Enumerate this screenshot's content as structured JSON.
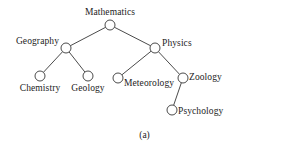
{
  "figure": {
    "caption": "(a)",
    "type": "tree-diagram",
    "background_color": "#ffffff",
    "line_color": "#2a2a2a",
    "text_color": "#1c1c1c"
  },
  "tree": {
    "nodes": [
      {
        "id": "mathematics",
        "label": "Mathematics",
        "x": 110,
        "y": 25,
        "r": 5,
        "label_x": 110,
        "label_y": 7,
        "label_align": "center"
      },
      {
        "id": "geography",
        "label": "Geography",
        "x": 66,
        "y": 48,
        "r": 5,
        "label_x": 59,
        "label_y": 36,
        "label_align": "right"
      },
      {
        "id": "physics",
        "label": "Physics",
        "x": 155,
        "y": 48,
        "r": 5,
        "label_x": 162,
        "label_y": 38,
        "label_align": "left"
      },
      {
        "id": "chemistry",
        "label": "Chemistry",
        "x": 40,
        "y": 76,
        "r": 5,
        "label_x": 40,
        "label_y": 83,
        "label_align": "center"
      },
      {
        "id": "geology",
        "label": "Geology",
        "x": 88,
        "y": 76,
        "r": 5,
        "label_x": 88,
        "label_y": 83,
        "label_align": "center"
      },
      {
        "id": "meteorology",
        "label": "Meteorology",
        "x": 118,
        "y": 78,
        "r": 5,
        "label_x": 124,
        "label_y": 78,
        "label_align": "left"
      },
      {
        "id": "zoology",
        "label": "Zoology",
        "x": 183,
        "y": 78,
        "r": 5,
        "label_x": 189,
        "label_y": 72,
        "label_align": "left"
      },
      {
        "id": "psychology",
        "label": "Psychology",
        "x": 172,
        "y": 110,
        "r": 5,
        "label_x": 178,
        "label_y": 106,
        "label_align": "left"
      }
    ],
    "edges": [
      {
        "from": "mathematics",
        "to": "geography"
      },
      {
        "from": "mathematics",
        "to": "physics"
      },
      {
        "from": "geography",
        "to": "chemistry"
      },
      {
        "from": "geography",
        "to": "geology"
      },
      {
        "from": "physics",
        "to": "meteorology"
      },
      {
        "from": "physics",
        "to": "zoology"
      },
      {
        "from": "zoology",
        "to": "psychology"
      }
    ]
  }
}
